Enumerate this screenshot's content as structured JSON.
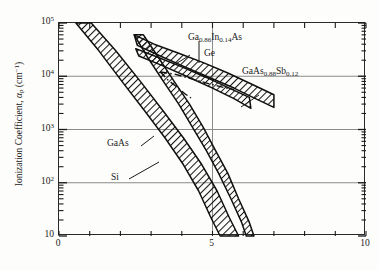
{
  "figure": {
    "header_faint": "",
    "background_color": "#fdfdfb",
    "ink_color": "#1a1a1a",
    "grid_color": "#8a8a8a"
  },
  "axes": {
    "y_title_prefix": "Ionization Coefficient, ",
    "y_title_symbol": "α",
    "y_title_symbol_sub": "p",
    "y_title_unit_open": " (cm",
    "y_title_unit_sup": "−1",
    "y_title_unit_close": ")",
    "y_ticks": [
      {
        "value": 100000,
        "mantissa": "10",
        "exponent": "5"
      },
      {
        "value": 10000,
        "mantissa": "10",
        "exponent": "4"
      },
      {
        "value": 1000,
        "mantissa": "10",
        "exponent": "3"
      },
      {
        "value": 100,
        "mantissa": "10",
        "exponent": "2"
      },
      {
        "value": 10,
        "mantissa": "10",
        "exponent": ""
      }
    ],
    "x_ticks_labeled": [
      "0",
      "5",
      "10"
    ],
    "x_tick_values_labeled": [
      0,
      5,
      10
    ],
    "x_tick_values_all": [
      0,
      1,
      2,
      3,
      4,
      5,
      6,
      7,
      8,
      9,
      10
    ],
    "gridlines_y": [
      10000,
      1000,
      100
    ],
    "gridlines_x": [
      5
    ]
  },
  "curve_labels": [
    {
      "id": "gainas",
      "text_pre": "Ga",
      "sub1": "0.86",
      "text_mid": "In",
      "sub2": "0.14",
      "text_post": "As"
    },
    {
      "id": "ge",
      "text_pre": "Ge",
      "sub1": "",
      "text_mid": "",
      "sub2": "",
      "text_post": ""
    },
    {
      "id": "gaassb",
      "text_pre": "GaAs",
      "sub1": "0.88",
      "text_mid": "Sb",
      "sub2": "0.12",
      "text_post": ""
    },
    {
      "id": "gaas",
      "text_pre": "GaAs",
      "sub1": "",
      "text_mid": "",
      "sub2": "",
      "text_post": ""
    },
    {
      "id": "si",
      "text_pre": "Si",
      "sub1": "",
      "text_mid": "",
      "sub2": "",
      "text_post": ""
    }
  ],
  "chart_data": {
    "type": "line",
    "title": "",
    "subtitle": "",
    "xlabel": "",
    "ylabel": "Ionization Coefficient, αp (cm⁻¹)",
    "xlim": [
      0,
      10
    ],
    "ylim": [
      10,
      100000
    ],
    "yscale": "log",
    "xscale": "linear",
    "grid": true,
    "grid_y_values": [
      10000,
      1000,
      100
    ],
    "grid_x_values": [
      5
    ],
    "legend": "inline-annotations",
    "legend_position": "inline",
    "series": [
      {
        "name": "Si",
        "style": "hatched-band",
        "label_text": "Si",
        "upper": [
          {
            "x": 0.55,
            "y": 100000
          },
          {
            "x": 1.3,
            "y": 30000
          },
          {
            "x": 2.05,
            "y": 8000
          },
          {
            "x": 2.8,
            "y": 2200
          },
          {
            "x": 3.45,
            "y": 700
          },
          {
            "x": 4.05,
            "y": 220
          },
          {
            "x": 4.55,
            "y": 70
          },
          {
            "x": 4.95,
            "y": 22
          },
          {
            "x": 5.25,
            "y": 10
          }
        ],
        "lower": [
          {
            "x": 1.05,
            "y": 100000
          },
          {
            "x": 1.85,
            "y": 30000
          },
          {
            "x": 2.65,
            "y": 8000
          },
          {
            "x": 3.4,
            "y": 2200
          },
          {
            "x": 4.05,
            "y": 700
          },
          {
            "x": 4.65,
            "y": 220
          },
          {
            "x": 5.15,
            "y": 70
          },
          {
            "x": 5.55,
            "y": 22
          },
          {
            "x": 5.85,
            "y": 10
          }
        ]
      },
      {
        "name": "GaAs",
        "style": "hatched-band",
        "label_text": "GaAs",
        "upper": [
          {
            "x": 2.45,
            "y": 60000
          },
          {
            "x": 2.9,
            "y": 22000
          },
          {
            "x": 3.4,
            "y": 8000
          },
          {
            "x": 3.9,
            "y": 3000
          },
          {
            "x": 4.35,
            "y": 1100
          },
          {
            "x": 4.8,
            "y": 400
          },
          {
            "x": 5.2,
            "y": 150
          },
          {
            "x": 5.6,
            "y": 50
          },
          {
            "x": 5.95,
            "y": 18
          },
          {
            "x": 6.1,
            "y": 10
          }
        ],
        "lower": [
          {
            "x": 2.75,
            "y": 60000
          },
          {
            "x": 3.25,
            "y": 22000
          },
          {
            "x": 3.75,
            "y": 8000
          },
          {
            "x": 4.25,
            "y": 3000
          },
          {
            "x": 4.7,
            "y": 1100
          },
          {
            "x": 5.1,
            "y": 400
          },
          {
            "x": 5.5,
            "y": 150
          },
          {
            "x": 5.85,
            "y": 50
          },
          {
            "x": 6.2,
            "y": 18
          },
          {
            "x": 6.35,
            "y": 10
          }
        ]
      },
      {
        "name": "Ga0.86In0.14As",
        "style": "hatched-band",
        "label_text": "Ga0.86In0.14As",
        "upper": [
          {
            "x": 2.45,
            "y": 60000
          },
          {
            "x": 3.1,
            "y": 40000
          },
          {
            "x": 3.9,
            "y": 27000
          },
          {
            "x": 4.7,
            "y": 18000
          },
          {
            "x": 5.5,
            "y": 11500
          },
          {
            "x": 6.3,
            "y": 7000
          },
          {
            "x": 7.0,
            "y": 4500
          }
        ],
        "lower": [
          {
            "x": 2.55,
            "y": 38000
          },
          {
            "x": 3.3,
            "y": 24000
          },
          {
            "x": 4.1,
            "y": 15000
          },
          {
            "x": 4.9,
            "y": 9500
          },
          {
            "x": 5.7,
            "y": 6000
          },
          {
            "x": 6.4,
            "y": 3800
          },
          {
            "x": 7.0,
            "y": 2600
          }
        ]
      },
      {
        "name": "GaAs0.88Sb0.12",
        "style": "hatched-band",
        "label_text": "GaAs0.88Sb0.12",
        "upper": [
          {
            "x": 2.5,
            "y": 33000
          },
          {
            "x": 3.2,
            "y": 23000
          },
          {
            "x": 4.0,
            "y": 15000
          },
          {
            "x": 4.8,
            "y": 9500
          },
          {
            "x": 5.6,
            "y": 5800
          },
          {
            "x": 6.2,
            "y": 4000
          }
        ],
        "lower": [
          {
            "x": 2.6,
            "y": 24000
          },
          {
            "x": 3.35,
            "y": 16000
          },
          {
            "x": 4.15,
            "y": 10000
          },
          {
            "x": 4.95,
            "y": 6200
          },
          {
            "x": 5.7,
            "y": 3800
          },
          {
            "x": 6.25,
            "y": 2500
          }
        ]
      },
      {
        "name": "Ge",
        "style": "dash-dot-line",
        "label_text": "Ge",
        "points": [
          {
            "x": 3.3,
            "y": 12000
          },
          {
            "x": 3.75,
            "y": 11000
          },
          {
            "x": 4.3,
            "y": 9000
          },
          {
            "x": 4.9,
            "y": 7200
          },
          {
            "x": 5.45,
            "y": 6000
          },
          {
            "x": 5.7,
            "y": 5600
          }
        ],
        "branch_points": [
          {
            "x": 3.3,
            "y": 12000
          },
          {
            "x": 3.55,
            "y": 8500
          },
          {
            "x": 3.85,
            "y": 6200
          },
          {
            "x": 4.1,
            "y": 4700
          },
          {
            "x": 4.3,
            "y": 3900
          }
        ]
      }
    ]
  }
}
